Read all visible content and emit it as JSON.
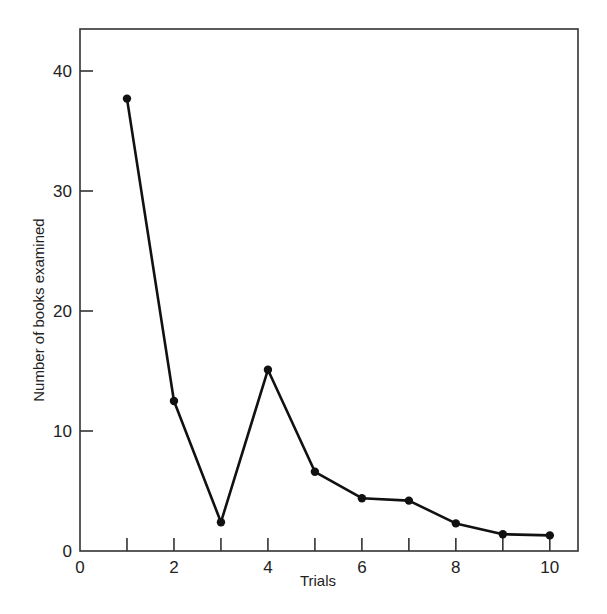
{
  "chart_data": {
    "type": "line",
    "title": "",
    "xlabel": "Trials",
    "ylabel": "Number of books examined",
    "x": [
      1,
      2,
      3,
      4,
      5,
      6,
      7,
      8,
      9,
      10
    ],
    "series": [
      {
        "name": "Books examined",
        "values": [
          37.7,
          12.5,
          2.4,
          15.1,
          6.6,
          4.4,
          4.2,
          2.3,
          1.4,
          1.3
        ]
      }
    ],
    "xlim": [
      0,
      10.6
    ],
    "ylim": [
      0,
      43.5
    ],
    "xticks": [
      0,
      1,
      2,
      3,
      4,
      5,
      6,
      7,
      8,
      9,
      10
    ],
    "xtick_labels": [
      "0",
      "2",
      "4",
      "6",
      "8",
      "10"
    ],
    "xtick_label_values": [
      0,
      2,
      4,
      6,
      8,
      10
    ],
    "yticks": [
      0,
      10,
      20,
      30,
      40
    ],
    "ytick_labels": [
      "0",
      "10",
      "20",
      "30",
      "40"
    ],
    "grid": false,
    "legend": "none",
    "colors": {
      "line": "#111111",
      "marker": "#111111",
      "frame": "#333333"
    }
  }
}
